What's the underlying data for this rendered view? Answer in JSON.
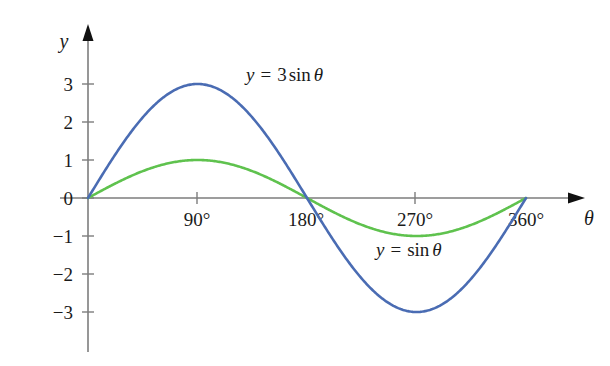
{
  "chart_data": {
    "type": "line",
    "title": "",
    "xlabel": "θ",
    "ylabel": "y",
    "xlim": [
      0,
      382
    ],
    "ylim": [
      -3.8,
      3.8
    ],
    "grid": false,
    "legend_position": "inline-annotation",
    "x_tick_labels": [
      "90°",
      "180°",
      "270°",
      "360°"
    ],
    "x_tick_values": [
      90,
      180,
      270,
      360
    ],
    "y_tick_labels": [
      "3",
      "2",
      "1",
      "0",
      "−1",
      "−2",
      "−3"
    ],
    "y_tick_values": [
      3,
      2,
      1,
      0,
      -1,
      -2,
      -3
    ],
    "series": [
      {
        "name": "y = 3 sin θ",
        "color": "#4a6cb3",
        "amplitude": 3,
        "x": [
          0,
          15,
          30,
          45,
          60,
          75,
          90,
          105,
          120,
          135,
          150,
          165,
          180,
          195,
          210,
          225,
          240,
          255,
          270,
          285,
          300,
          315,
          330,
          345,
          360
        ],
        "values": [
          0,
          0.78,
          1.5,
          2.12,
          2.6,
          2.9,
          3,
          2.9,
          2.6,
          2.12,
          1.5,
          0.78,
          0,
          -0.78,
          -1.5,
          -2.12,
          -2.6,
          -2.9,
          -3,
          -2.9,
          -2.6,
          -2.12,
          -1.5,
          -0.78,
          0
        ]
      },
      {
        "name": "y = sin θ",
        "color": "#5fc24e",
        "amplitude": 1,
        "x": [
          0,
          15,
          30,
          45,
          60,
          75,
          90,
          105,
          120,
          135,
          150,
          165,
          180,
          195,
          210,
          225,
          240,
          255,
          270,
          285,
          300,
          315,
          330,
          345,
          360
        ],
        "values": [
          0,
          0.26,
          0.5,
          0.71,
          0.87,
          0.97,
          1,
          0.97,
          0.87,
          0.71,
          0.5,
          0.26,
          0,
          -0.26,
          -0.5,
          -0.71,
          -0.87,
          -0.97,
          -1,
          -0.97,
          -0.87,
          -0.71,
          -0.5,
          -0.26,
          0
        ]
      }
    ],
    "annotations": [
      {
        "text": "y = 3 sin θ",
        "color": "#4a6cb3",
        "x": 140,
        "y": 2.9
      },
      {
        "text": "y = sin θ",
        "color": "#5fc24e",
        "x": 255,
        "y": -1.45
      }
    ]
  },
  "axes": {
    "y_axis_label": "y",
    "x_axis_label": "θ"
  },
  "y_ticks": [
    {
      "label": "3"
    },
    {
      "label": "2"
    },
    {
      "label": "1"
    },
    {
      "label": "0"
    },
    {
      "label": "−1"
    },
    {
      "label": "−2"
    },
    {
      "label": "−3"
    }
  ],
  "x_ticks": [
    {
      "label": "90°"
    },
    {
      "label": "180°"
    },
    {
      "label": "270°"
    },
    {
      "label": "360°"
    }
  ],
  "curve_labels": {
    "blue": {
      "y": "y",
      "eq": "=",
      "coef": "3",
      "fn": "sin",
      "var": "θ"
    },
    "green": {
      "y": "y",
      "eq": "=",
      "fn": "sin",
      "var": "θ"
    }
  },
  "colors": {
    "blue_curve": "#4a6cb3",
    "green_curve": "#5fc24e",
    "axis": "#7d7d7d",
    "text": "#1a1a1a",
    "background": "#ffffff"
  }
}
